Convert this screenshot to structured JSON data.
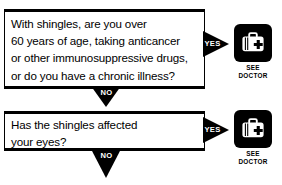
{
  "flowchart": {
    "title": "Shingles self-assessment flowchart",
    "colors": {
      "ink": "#000000",
      "background": "#ffffff",
      "label_text": "#ffffff"
    },
    "questions": [
      {
        "id": "q1",
        "text": "With shingles, are you over\n60 years of age, taking anticancer\nor other immunosuppressive drugs,\nor do you have a chronic illness?",
        "yes_label": "YES",
        "no_label": "NO"
      },
      {
        "id": "q2",
        "text": "Has the shingles affected\nyour eyes?",
        "yes_label": "YES",
        "no_label": "NO"
      }
    ],
    "outcomes": [
      {
        "id": "outcome1",
        "icon": "medical-bag-icon",
        "label": "SEE\nDOCTOR"
      },
      {
        "id": "outcome2",
        "icon": "medical-bag-icon",
        "label": "SEE\nDOCTOR"
      }
    ]
  }
}
